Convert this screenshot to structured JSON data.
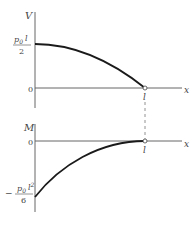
{
  "top_plot": {
    "y_axis_label": "V",
    "x_axis_label": "x",
    "y_value_label": {
      "numerator": "p0 l",
      "p": "p",
      "sub": "0",
      "var": "l",
      "denominator": "2"
    },
    "origin_label": "0",
    "x_end_label": "l",
    "curve": "parabolic decreasing from p0 l/2 at x=0 to 0 at x=l"
  },
  "bottom_plot": {
    "y_axis_label": "M",
    "x_axis_label": "x",
    "y_value_label": {
      "sign": "−",
      "p": "p",
      "sub": "0",
      "var": "l",
      "sup": "2",
      "denominator": "6"
    },
    "origin_label": "0",
    "x_end_label": "l",
    "curve": "cubic increasing from −p0 l²/6 at x=0 to 0 at x=l"
  },
  "colors": {
    "curve": "#1a1a1a",
    "axis": "#555555"
  }
}
